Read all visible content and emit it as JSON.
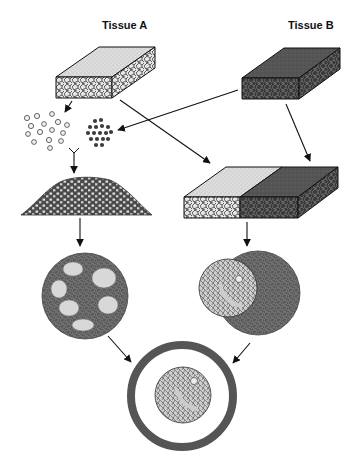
{
  "diagram": {
    "labels": {
      "tissue_a": "Tissue A",
      "tissue_b": "Tissue B"
    },
    "colors": {
      "tissue_a_light": "#d9d9d9",
      "tissue_b_dark": "#555555",
      "outline": "#1a1a1a",
      "background": "#ffffff"
    },
    "nodes": [
      {
        "id": "block-a",
        "description": "Intact tissue A block (light)"
      },
      {
        "id": "block-b",
        "description": "Intact tissue B block (dark)"
      },
      {
        "id": "dissociated-a",
        "description": "Dissociated cells of tissue A (light)"
      },
      {
        "id": "dissociated-b",
        "description": "Dissociated cells of tissue B (dark)"
      },
      {
        "id": "mixed-aggregate",
        "description": "Mixed cell aggregate heap"
      },
      {
        "id": "recombined-block",
        "description": "Recombined tissue A + B block"
      },
      {
        "id": "sorted-sphere",
        "description": "Sphere with sorted light cell clusters in dark matrix"
      },
      {
        "id": "organized-sphere",
        "description": "Sphere with organized light structure on dark tissue"
      },
      {
        "id": "final-structure",
        "description": "Ring-enclosed organized structure"
      }
    ],
    "edges": [
      {
        "from": "block-a",
        "to": "dissociated-a"
      },
      {
        "from": "block-b",
        "to": "dissociated-b"
      },
      {
        "from": "block-a",
        "to": "recombined-block"
      },
      {
        "from": "block-b",
        "to": "recombined-block"
      },
      {
        "from": "dissociated-a",
        "to": "mixed-aggregate"
      },
      {
        "from": "dissociated-b",
        "to": "mixed-aggregate"
      },
      {
        "from": "mixed-aggregate",
        "to": "sorted-sphere"
      },
      {
        "from": "recombined-block",
        "to": "organized-sphere"
      },
      {
        "from": "sorted-sphere",
        "to": "final-structure"
      },
      {
        "from": "organized-sphere",
        "to": "final-structure"
      }
    ]
  }
}
